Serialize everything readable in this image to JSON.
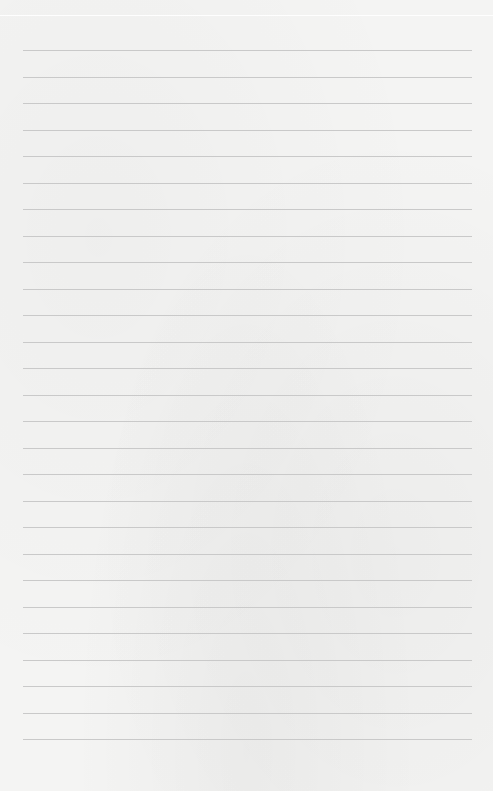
{
  "page": {
    "type": "lined-paper",
    "background_color": "#f4f4f3",
    "rule_color": "#c9c9c9",
    "rule_count": 27,
    "first_rule_y": 50,
    "rule_spacing": 26.5,
    "rule_left": 23,
    "rule_right": 472
  }
}
